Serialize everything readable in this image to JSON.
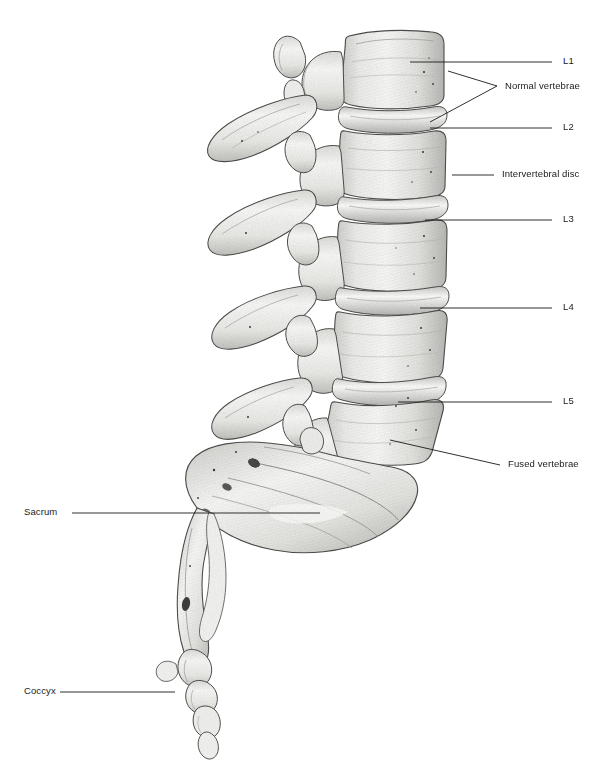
{
  "figure": {
    "background_color": "#ffffff",
    "ink_color": "#1a1a1a",
    "bone_fill": "#f2f2f0",
    "shade_color": "#9a9a98"
  },
  "labels": {
    "l1": "L1",
    "normal_vertebrae": "Normal vertebrae",
    "l2": "L2",
    "intervertebral_disc": "Intervertebral disc",
    "l3": "L3",
    "l4": "L4",
    "l5": "L5",
    "fused_vertebrae": "Fused vertebrae",
    "sacrum": "Sacrum",
    "coccyx": "Coccyx"
  },
  "leaders": {
    "l1": {
      "x1": 410,
      "y1": 62,
      "x2": 552,
      "y2": 62
    },
    "normal_a": {
      "x1": 430,
      "y1": 122,
      "x2": 497,
      "y2": 86
    },
    "normal_b": {
      "x1": 448,
      "y1": 71,
      "x2": 497,
      "y2": 86
    },
    "l2": {
      "x1": 430,
      "y1": 128,
      "x2": 552,
      "y2": 128
    },
    "disc": {
      "x1": 452,
      "y1": 175,
      "x2": 494,
      "y2": 175
    },
    "l3": {
      "x1": 425,
      "y1": 220,
      "x2": 552,
      "y2": 220
    },
    "l4": {
      "x1": 420,
      "y1": 308,
      "x2": 552,
      "y2": 308
    },
    "l5": {
      "x1": 398,
      "y1": 402,
      "x2": 552,
      "y2": 402
    },
    "fused": {
      "x1": 390,
      "y1": 440,
      "x2": 500,
      "y2": 465
    },
    "sacrum": {
      "x1": 72,
      "y1": 513,
      "x2": 320,
      "y2": 513
    },
    "coccyx": {
      "x1": 60,
      "y1": 692,
      "x2": 175,
      "y2": 692
    }
  },
  "label_positions": {
    "l1": {
      "left": 563,
      "top": 56
    },
    "normal_vertebrae": {
      "left": 505,
      "top": 81
    },
    "l2": {
      "left": 563,
      "top": 122
    },
    "intervertebral_disc": {
      "left": 502,
      "top": 169
    },
    "l3": {
      "left": 563,
      "top": 214
    },
    "l4": {
      "left": 563,
      "top": 302
    },
    "l5": {
      "left": 563,
      "top": 396
    },
    "fused_vertebrae": {
      "left": 508,
      "top": 459
    },
    "sacrum": {
      "left": 24,
      "top": 507
    },
    "coccyx": {
      "left": 24,
      "top": 686
    }
  },
  "anatomy": {
    "vertebrae": [
      "L1",
      "L2",
      "L3",
      "L4",
      "L5"
    ],
    "discs_count": 4,
    "sacrum_segments": 5,
    "coccyx_segments": 4,
    "view": "lateral (side) view, left-facing spinous processes"
  }
}
